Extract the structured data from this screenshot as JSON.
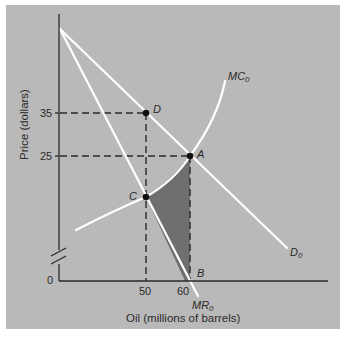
{
  "figure": {
    "type": "economics-diagram",
    "background": "#b9b9b9",
    "frame_border": "#ffffff",
    "shade_color": "#6f6f6f",
    "curve_color": "#ffffff",
    "axis_color": "#2a2a2a"
  },
  "axes": {
    "y_title": "Price (dollars)",
    "x_title": "Oil (millions of barrels)",
    "origin_label": "0",
    "y_ticks": [
      {
        "label": "35",
        "value": 35
      },
      {
        "label": "25",
        "value": 25
      }
    ],
    "x_ticks": [
      {
        "label": "50",
        "value": 50
      },
      {
        "label": "60",
        "value": 60
      }
    ],
    "y_axis_break": true
  },
  "curves": {
    "demand": {
      "label": "D",
      "subscript": "0"
    },
    "marginal_revenue": {
      "label": "MR",
      "subscript": "0"
    },
    "marginal_cost": {
      "label": "MC",
      "subscript": "0"
    }
  },
  "points": {
    "A": {
      "label": "A",
      "quantity": 60,
      "price": 25,
      "desc": "MC0 intersects D0"
    },
    "B": {
      "label": "B",
      "quantity": 60,
      "price": 0,
      "desc": "Quantity 60 on x-axis"
    },
    "C": {
      "label": "C",
      "quantity": 50,
      "desc": "MR0 intersects MC0"
    },
    "D": {
      "label": "D",
      "quantity": 50,
      "price": 35,
      "desc": "Demand at quantity 50"
    }
  },
  "shaded_region": {
    "vertices": [
      "C",
      "A",
      "B"
    ],
    "desc": "Deadweight loss triangle between MC0 and MR0 from quantity 50 to 60"
  }
}
